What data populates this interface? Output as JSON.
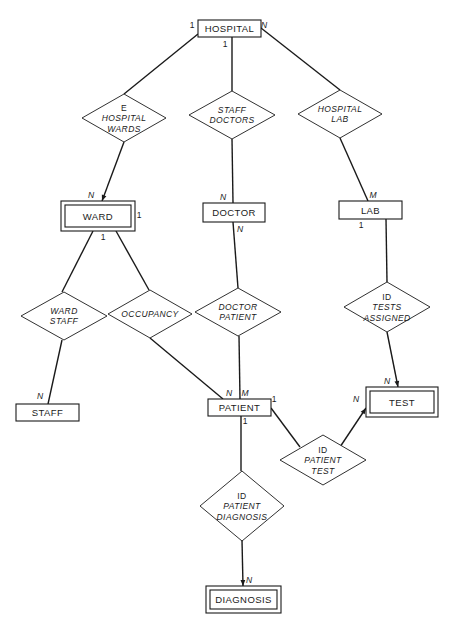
{
  "diagram": {
    "type": "entity-relationship",
    "entities": [
      {
        "id": "hospital",
        "label": "HOSPITAL",
        "weak": false,
        "x": 198,
        "y": 20,
        "w": 63,
        "h": 17
      },
      {
        "id": "ward",
        "label": "WARD",
        "weak": true,
        "x": 61,
        "y": 201,
        "w": 74,
        "h": 30
      },
      {
        "id": "doctor",
        "label": "DOCTOR",
        "weak": false,
        "x": 203,
        "y": 203,
        "w": 62,
        "h": 19
      },
      {
        "id": "lab",
        "label": "LAB",
        "weak": false,
        "x": 339,
        "y": 201,
        "w": 63,
        "h": 18
      },
      {
        "id": "staff",
        "label": "STAFF",
        "weak": false,
        "x": 16,
        "y": 404,
        "w": 63,
        "h": 17
      },
      {
        "id": "patient",
        "label": "PATIENT",
        "weak": false,
        "x": 208,
        "y": 399,
        "w": 63,
        "h": 17
      },
      {
        "id": "test",
        "label": "TEST",
        "weak": true,
        "x": 366,
        "y": 387,
        "w": 72,
        "h": 30
      },
      {
        "id": "diagnosis",
        "label": "DIAGNOSIS",
        "weak": true,
        "x": 206,
        "y": 586,
        "w": 75,
        "h": 27
      }
    ],
    "relationships": [
      {
        "id": "hospital_wards",
        "prefix": "E",
        "lines": [
          "HOSPITAL",
          "WARDS"
        ],
        "cx": 124,
        "cy": 118,
        "hw": 42,
        "hh": 24
      },
      {
        "id": "staff_doctors",
        "prefix": "",
        "lines": [
          "STAFF",
          "DOCTORS"
        ],
        "cx": 232,
        "cy": 115,
        "hw": 43,
        "hh": 24
      },
      {
        "id": "hospital_lab",
        "prefix": "",
        "lines": [
          "HOSPITAL",
          "LAB"
        ],
        "cx": 340,
        "cy": 114,
        "hw": 42,
        "hh": 24
      },
      {
        "id": "ward_staff",
        "prefix": "",
        "lines": [
          "WARD",
          "STAFF"
        ],
        "cx": 64,
        "cy": 316,
        "hw": 43,
        "hh": 24
      },
      {
        "id": "occupancy",
        "prefix": "",
        "lines": [
          "OCCUPANCY"
        ],
        "cx": 150,
        "cy": 314,
        "hw": 42,
        "hh": 24
      },
      {
        "id": "doctor_patient",
        "prefix": "",
        "lines": [
          "DOCTOR",
          "PATIENT"
        ],
        "cx": 238,
        "cy": 312,
        "hw": 43,
        "hh": 24
      },
      {
        "id": "tests_assigned",
        "prefix": "ID",
        "lines": [
          "TESTS",
          "ASSIGNED"
        ],
        "cx": 387,
        "cy": 307,
        "hw": 43,
        "hh": 25
      },
      {
        "id": "patient_test",
        "prefix": "ID",
        "lines": [
          "PATIENT",
          "TEST"
        ],
        "cx": 323,
        "cy": 460,
        "hw": 43,
        "hh": 25
      },
      {
        "id": "patient_diagnosis",
        "prefix": "ID",
        "lines": [
          "PATIENT",
          "DIAGNOSIS"
        ],
        "cx": 242,
        "cy": 506,
        "hw": 42,
        "hh": 35
      }
    ],
    "edges": [
      {
        "from": [
          198,
          34
        ],
        "to": [
          124,
          94
        ],
        "arrow": false
      },
      {
        "from": [
          232,
          37
        ],
        "to": [
          232,
          91
        ],
        "arrow": false
      },
      {
        "from": [
          261,
          28
        ],
        "to": [
          340,
          90
        ],
        "arrow": false
      },
      {
        "from": [
          124,
          142
        ],
        "to": [
          102,
          201
        ],
        "arrow": true
      },
      {
        "from": [
          232,
          139
        ],
        "to": [
          233,
          203
        ],
        "arrow": false
      },
      {
        "from": [
          340,
          138
        ],
        "to": [
          368,
          201
        ],
        "arrow": false
      },
      {
        "from": [
          93,
          231
        ],
        "to": [
          62,
          292
        ],
        "arrow": false
      },
      {
        "from": [
          116,
          231
        ],
        "to": [
          149,
          290
        ],
        "arrow": false
      },
      {
        "from": [
          233,
          222
        ],
        "to": [
          238,
          288
        ],
        "arrow": false
      },
      {
        "from": [
          386,
          219
        ],
        "to": [
          387,
          282
        ],
        "arrow": false
      },
      {
        "from": [
          62,
          340
        ],
        "to": [
          48,
          404
        ],
        "arrow": false
      },
      {
        "from": [
          150,
          338
        ],
        "to": [
          223,
          399
        ],
        "arrow": false
      },
      {
        "from": [
          239,
          336
        ],
        "to": [
          240,
          399
        ],
        "arrow": false
      },
      {
        "from": [
          387,
          332
        ],
        "to": [
          398,
          387
        ],
        "arrow": true
      },
      {
        "from": [
          271,
          408
        ],
        "to": [
          300,
          447
        ],
        "arrow": false
      },
      {
        "from": [
          340,
          447
        ],
        "to": [
          366,
          408
        ],
        "arrow": true
      },
      {
        "from": [
          241,
          416
        ],
        "to": [
          241,
          471
        ],
        "arrow": false
      },
      {
        "from": [
          242,
          540
        ],
        "to": [
          243,
          586
        ],
        "arrow": true
      }
    ],
    "cardinalities": [
      {
        "text": "1",
        "x": 192,
        "y": 28,
        "italic": false
      },
      {
        "text": "N",
        "x": 264,
        "y": 28,
        "italic": true
      },
      {
        "text": "1",
        "x": 225,
        "y": 47,
        "italic": false
      },
      {
        "text": "N",
        "x": 91,
        "y": 198,
        "italic": true
      },
      {
        "text": "1",
        "x": 139,
        "y": 218,
        "italic": false
      },
      {
        "text": "1",
        "x": 103,
        "y": 240,
        "italic": false
      },
      {
        "text": "N",
        "x": 223,
        "y": 200,
        "italic": true
      },
      {
        "text": "N",
        "x": 240,
        "y": 232,
        "italic": true
      },
      {
        "text": "M",
        "x": 373,
        "y": 198,
        "italic": true
      },
      {
        "text": "1",
        "x": 361,
        "y": 228,
        "italic": false
      },
      {
        "text": "N",
        "x": 40,
        "y": 399,
        "italic": true
      },
      {
        "text": "N",
        "x": 229,
        "y": 396,
        "italic": true
      },
      {
        "text": "M",
        "x": 245,
        "y": 396,
        "italic": true
      },
      {
        "text": "1",
        "x": 274,
        "y": 402,
        "italic": false
      },
      {
        "text": "1",
        "x": 245,
        "y": 424,
        "italic": false
      },
      {
        "text": "N",
        "x": 356,
        "y": 402,
        "italic": true
      },
      {
        "text": "N",
        "x": 387,
        "y": 384,
        "italic": true
      },
      {
        "text": "N",
        "x": 249,
        "y": 583,
        "italic": true
      }
    ]
  }
}
